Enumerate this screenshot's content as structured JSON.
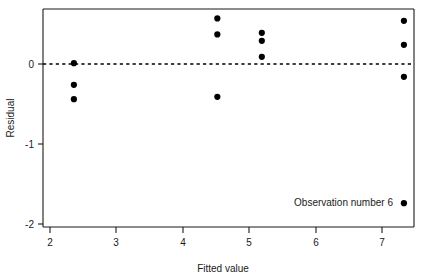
{
  "chart_data": {
    "type": "scatter",
    "title": "",
    "xlabel": "Fitted value",
    "ylabel": "Residual",
    "xlim": [
      1.9,
      7.48
    ],
    "ylim": [
      -2.04,
      0.71
    ],
    "xticks": [
      2,
      3,
      4,
      5,
      6,
      7
    ],
    "xticklabels": [
      "2",
      "3",
      "4",
      "5",
      "6",
      "7"
    ],
    "yticks": [
      0,
      -1,
      -2
    ],
    "yticklabels": [
      "0",
      "-1",
      "-2"
    ],
    "grid": false,
    "legend": "none",
    "reference_line": {
      "orientation": "horizontal",
      "y": 0,
      "style": "dashed"
    },
    "points": [
      {
        "x": 2.36,
        "y": 0.01
      },
      {
        "x": 2.36,
        "y": -0.26
      },
      {
        "x": 2.36,
        "y": -0.44
      },
      {
        "x": 4.52,
        "y": 0.57
      },
      {
        "x": 4.52,
        "y": 0.37
      },
      {
        "x": 4.52,
        "y": -0.41
      },
      {
        "x": 5.19,
        "y": 0.39
      },
      {
        "x": 5.19,
        "y": 0.29
      },
      {
        "x": 5.19,
        "y": 0.09
      },
      {
        "x": 7.33,
        "y": 0.54
      },
      {
        "x": 7.33,
        "y": 0.24
      },
      {
        "x": 7.33,
        "y": -0.16
      },
      {
        "x": 7.33,
        "y": -1.74
      }
    ],
    "annotations": [
      {
        "text": "Observation number 6",
        "x": 7.33,
        "y": -1.74,
        "position": "left-of-point"
      }
    ]
  },
  "axes": {
    "x_title": "Fitted value",
    "y_title": "Residual",
    "x_tick_labels": [
      "2",
      "3",
      "4",
      "5",
      "6",
      "7"
    ],
    "y_tick_labels": [
      "0",
      "-1",
      "-2"
    ]
  },
  "annotation": {
    "outlier_label": "Observation number 6"
  },
  "colors": {
    "point": "#000000",
    "axis": "#1a1a1a",
    "background": "#ffffff",
    "reference_line": "#000000"
  }
}
